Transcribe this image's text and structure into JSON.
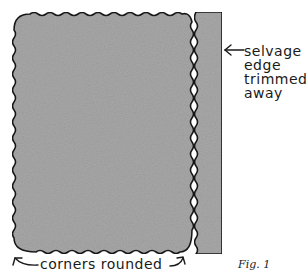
{
  "figure": {
    "caption": "Fig. 1",
    "labels": {
      "selvage_line1": "selvage",
      "selvage_line2": "edge",
      "selvage_line3": "trimmed",
      "selvage_line4": "away",
      "corners": "corners rounded"
    },
    "colors": {
      "fabric_fill": "#a8a8a8",
      "outline": "#1a1a1a",
      "background": "#ffffff"
    }
  }
}
